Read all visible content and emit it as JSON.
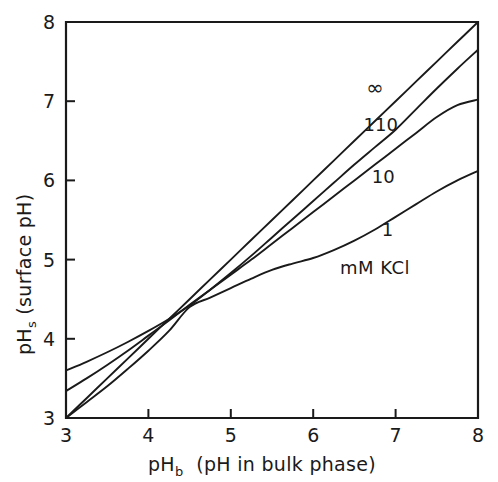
{
  "chart_data": {
    "type": "line",
    "title": "",
    "xlabel": "pHb  (pH in bulk phase)",
    "xlabel_main": "pH",
    "xlabel_sub": "b",
    "xlabel_rest": "(pH in bulk phase)",
    "ylabel": "pHs (surface pH)",
    "ylabel_main": "pH",
    "ylabel_sub": "s",
    "ylabel_rest": "(surface pH)",
    "xlim": [
      3,
      8
    ],
    "ylim": [
      3,
      8
    ],
    "xticks": [
      3,
      4,
      5,
      6,
      7,
      8
    ],
    "yticks": [
      3,
      4,
      5,
      6,
      7,
      8
    ],
    "xtick_labels": [
      "3",
      "4",
      "5",
      "6",
      "7",
      "8"
    ],
    "ytick_labels": [
      "3",
      "4",
      "5",
      "6",
      "7",
      "8"
    ],
    "grid": false,
    "legend_position": "inline-curve-labels",
    "units_annotation": "mM  KCl",
    "line_color": "#1a1a1a",
    "x": [
      3.0,
      3.25,
      3.5,
      3.75,
      4.0,
      4.25,
      4.5,
      4.75,
      5.0,
      5.25,
      5.5,
      5.75,
      6.0,
      6.25,
      6.5,
      6.75,
      7.0,
      7.25,
      7.5,
      7.75,
      8.0
    ],
    "series": [
      {
        "name": "∞",
        "label": "∞",
        "label_x": 6.75,
        "label_y": 7.08,
        "values": [
          3.0,
          3.25,
          3.5,
          3.75,
          4.0,
          4.25,
          4.5,
          4.75,
          5.0,
          5.25,
          5.5,
          5.75,
          6.0,
          6.25,
          6.5,
          6.75,
          7.0,
          7.25,
          7.5,
          7.75,
          8.0
        ]
      },
      {
        "name": "110",
        "label": "110",
        "label_x": 6.82,
        "label_y": 6.63,
        "values": [
          3.6,
          3.71,
          3.83,
          3.96,
          4.1,
          4.25,
          4.42,
          4.62,
          4.83,
          5.05,
          5.28,
          5.51,
          5.74,
          5.97,
          6.2,
          6.42,
          6.64,
          6.9,
          7.16,
          7.41,
          7.65
        ]
      },
      {
        "name": "10",
        "label": "10",
        "label_x": 6.85,
        "label_y": 5.97,
        "values": [
          3.34,
          3.5,
          3.67,
          3.85,
          4.04,
          4.23,
          4.43,
          4.62,
          4.81,
          5.0,
          5.2,
          5.4,
          5.6,
          5.8,
          6.0,
          6.2,
          6.4,
          6.6,
          6.8,
          6.95,
          7.02
        ]
      },
      {
        "name": "1",
        "label": "1",
        "label_x": 6.9,
        "label_y": 5.3,
        "values": [
          3.0,
          3.2,
          3.4,
          3.62,
          3.85,
          4.1,
          4.4,
          4.52,
          4.64,
          4.76,
          4.87,
          4.95,
          5.02,
          5.12,
          5.24,
          5.38,
          5.54,
          5.7,
          5.86,
          6.0,
          6.12
        ]
      }
    ]
  },
  "annotations": {
    "units": "mM  KCl",
    "units_x": 6.75,
    "units_y": 4.82
  }
}
